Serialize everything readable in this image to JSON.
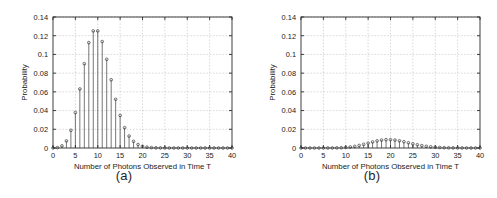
{
  "figure": {
    "background": "#ffffff",
    "panel_count": 2
  },
  "panels": [
    {
      "caption": "(a)",
      "xlabel": "Number of Photons Observed in Time T",
      "ylabel": "Probability"
    },
    {
      "caption": "(b)",
      "xlabel": "Number of Photons Observed in Time T",
      "ylabel": "Probability"
    }
  ],
  "chart_data": [
    {
      "type": "bar",
      "style": "stem",
      "title": "(a)",
      "xlabel": "Number of Photons Observed in Time T",
      "ylabel": "Probability",
      "xlim": [
        0,
        40
      ],
      "ylim": [
        0,
        0.14
      ],
      "xticks": [
        0,
        5,
        10,
        15,
        20,
        25,
        30,
        35,
        40
      ],
      "xtick_labels": [
        "0",
        "5",
        "10",
        "15",
        "20",
        "25",
        "30",
        "35",
        "40"
      ],
      "yticks": [
        0,
        0.02,
        0.04,
        0.06,
        0.08,
        0.1,
        0.12,
        0.14
      ],
      "ytick_labels": [
        "0",
        "0.02",
        "0.04",
        "0.06",
        "0.08",
        "0.1",
        "0.12",
        "0.14"
      ],
      "grid": true,
      "legend": "none",
      "distribution": "Poisson",
      "lambda": 10,
      "marker": "circle",
      "categories": [
        0,
        1,
        2,
        3,
        4,
        5,
        6,
        7,
        8,
        9,
        10,
        11,
        12,
        13,
        14,
        15,
        16,
        17,
        18,
        19,
        20,
        21,
        22,
        23,
        24,
        25,
        26,
        27,
        28,
        29,
        30,
        31,
        32,
        33,
        34,
        35,
        36,
        37,
        38,
        39,
        40
      ],
      "values": [
        5e-05,
        0.00045,
        0.00227,
        0.00757,
        0.01892,
        0.03783,
        0.06306,
        0.09008,
        0.1126,
        0.12511,
        0.12511,
        0.11374,
        0.09478,
        0.07291,
        0.05208,
        0.03472,
        0.0217,
        0.01276,
        0.00709,
        0.00373,
        0.00187,
        0.00089,
        0.0004,
        0.00018,
        7e-05,
        3e-05,
        1e-05,
        0.0,
        0.0,
        0.0,
        0.0,
        0.0,
        0.0,
        0.0,
        0.0,
        0.0,
        0.0,
        0.0,
        0.0,
        0.0,
        0.0
      ]
    },
    {
      "type": "bar",
      "style": "stem",
      "title": "(b)",
      "xlabel": "Number of Photons Observed in Time T",
      "ylabel": "Probability",
      "xlim": [
        0,
        40
      ],
      "ylim": [
        0,
        0.14
      ],
      "xticks": [
        0,
        5,
        10,
        15,
        20,
        25,
        30,
        35,
        40
      ],
      "xtick_labels": [
        "0",
        "5",
        "10",
        "15",
        "20",
        "25",
        "30",
        "35",
        "40"
      ],
      "yticks": [
        0,
        0.02,
        0.04,
        0.06,
        0.08,
        0.1,
        0.12,
        0.14
      ],
      "ytick_labels": [
        "0",
        "0.02",
        "0.04",
        "0.06",
        "0.08",
        "0.1",
        "0.12",
        "0.14"
      ],
      "grid": true,
      "legend": "none",
      "distribution": "Poisson",
      "lambda": 20,
      "marker": "circle",
      "categories": [
        0,
        1,
        2,
        3,
        4,
        5,
        6,
        7,
        8,
        9,
        10,
        11,
        12,
        13,
        14,
        15,
        16,
        17,
        18,
        19,
        20,
        21,
        22,
        23,
        24,
        25,
        26,
        27,
        28,
        29,
        30,
        31,
        32,
        33,
        34,
        35,
        36,
        37,
        38,
        39,
        40
      ],
      "values": [
        0.0,
        0.0,
        0.0,
        0.0,
        0.0,
        1e-05,
        2e-05,
        5e-05,
        0.00013,
        0.00029,
        0.00058,
        0.00106,
        0.00176,
        0.00271,
        0.00387,
        0.00516,
        0.00646,
        0.0076,
        0.00844,
        0.00888,
        0.00888,
        0.00846,
        0.00769,
        0.00669,
        0.00557,
        0.00446,
        0.00343,
        0.00254,
        0.00181,
        0.00125,
        0.00083,
        0.00054,
        0.00034,
        0.0002,
        0.00012,
        7e-05,
        4e-05,
        2e-05,
        1e-05,
        1e-05,
        0.0
      ]
    }
  ]
}
